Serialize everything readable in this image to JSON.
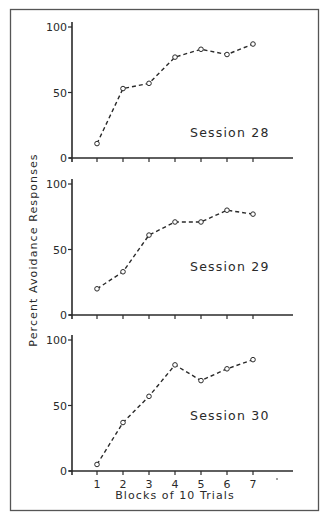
{
  "figure": {
    "ylabel": "Percent Avoidance Responses",
    "xlabel": "Blocks of 10 Trials",
    "colors": {
      "ink": "#2a2a2a",
      "frame": "#555555",
      "background": "#ffffff"
    }
  },
  "chart_data": [
    {
      "type": "line",
      "title": "Session 28",
      "x": [
        1,
        2,
        3,
        4,
        5,
        6,
        7
      ],
      "values": [
        11,
        53,
        57,
        77,
        83,
        79,
        87
      ],
      "xlabel": "",
      "ylabel": "Percent Avoidance Responses",
      "ylim": [
        0,
        100
      ],
      "yticks": [
        0,
        50,
        100
      ],
      "line_style": "dashed",
      "marker": "open-circle",
      "grid": false
    },
    {
      "type": "line",
      "title": "Session 29",
      "x": [
        1,
        2,
        3,
        4,
        5,
        6,
        7
      ],
      "values": [
        20,
        33,
        61,
        71,
        71,
        80,
        77
      ],
      "xlabel": "",
      "ylabel": "Percent Avoidance Responses",
      "ylim": [
        0,
        100
      ],
      "yticks": [
        0,
        50,
        100
      ],
      "line_style": "dashed",
      "marker": "open-circle",
      "grid": false
    },
    {
      "type": "line",
      "title": "Session 30",
      "x": [
        1,
        2,
        3,
        4,
        5,
        6,
        7
      ],
      "values": [
        5,
        37,
        57,
        81,
        69,
        78,
        85
      ],
      "xlabel": "Blocks of 10 Trials",
      "ylabel": "Percent Avoidance Responses",
      "ylim": [
        0,
        100
      ],
      "yticks": [
        0,
        50,
        100
      ],
      "xticks": [
        1,
        2,
        3,
        4,
        5,
        6,
        7
      ],
      "line_style": "dashed",
      "marker": "open-circle",
      "grid": false
    }
  ]
}
